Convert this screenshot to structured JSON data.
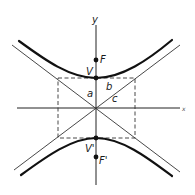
{
  "diagram": {
    "type": "hyperbola",
    "axes": {
      "x_label": "x",
      "y_label": "y"
    },
    "points": {
      "focus_upper": "F",
      "vertex_upper": "V",
      "vertex_lower": "V'",
      "focus_lower": "F'"
    },
    "segments": {
      "semi_major": "a",
      "semi_minor": "b",
      "focal_distance": "c"
    },
    "colors": {
      "stroke": "#1a1a1a",
      "background": "#ffffff"
    }
  }
}
